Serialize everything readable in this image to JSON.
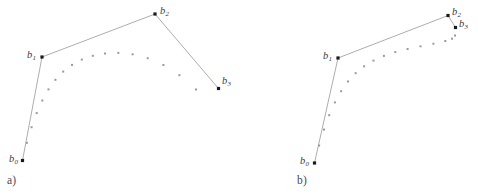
{
  "figure": {
    "background_color": "#ffffff",
    "width": 478,
    "height": 194,
    "polygon_color": "#8a8a8a",
    "polygon_width": 0.7,
    "sample_dot_color": "#9a9a9a",
    "control_point_color": "#1a1a1a",
    "label_color": "#3a3a3a"
  },
  "panels": [
    {
      "id": "a",
      "caption": "a)",
      "caption_x": 7,
      "caption_y": 174,
      "control_points": [
        {
          "name": "b0",
          "letter": "b",
          "sub": "0",
          "x": 22.5,
          "y": 160.5,
          "label_x": 9,
          "label_y": 154,
          "label_anchor": "left"
        },
        {
          "name": "b1",
          "letter": "b",
          "sub": "1",
          "x": 42.0,
          "y": 57.0,
          "label_x": 27,
          "label_y": 50,
          "label_anchor": "left"
        },
        {
          "name": "b2",
          "letter": "b",
          "sub": "2",
          "x": 155.0,
          "y": 14.0,
          "label_x": 160,
          "label_y": 6,
          "label_anchor": "left"
        },
        {
          "name": "b3",
          "letter": "b",
          "sub": "3",
          "x": 218.5,
          "y": 88.5,
          "label_x": 222,
          "label_y": 76,
          "label_anchor": "left"
        }
      ],
      "sample_dots": [
        {
          "t": 0.06,
          "x": 26.9,
          "y": 142.8
        },
        {
          "t": 0.12,
          "x": 31.6,
          "y": 127.2
        },
        {
          "t": 0.18,
          "x": 36.7,
          "y": 113.1
        },
        {
          "t": 0.24,
          "x": 42.3,
          "y": 100.5
        },
        {
          "t": 0.3,
          "x": 48.5,
          "y": 89.4
        },
        {
          "t": 0.36,
          "x": 55.4,
          "y": 79.8
        },
        {
          "t": 0.42,
          "x": 63.2,
          "y": 71.6
        },
        {
          "t": 0.48,
          "x": 72.0,
          "y": 64.9
        },
        {
          "t": 0.54,
          "x": 81.8,
          "y": 59.6
        },
        {
          "t": 0.6,
          "x": 92.8,
          "y": 55.8
        },
        {
          "t": 0.66,
          "x": 105.0,
          "y": 53.5
        },
        {
          "t": 0.72,
          "x": 118.3,
          "y": 52.9
        },
        {
          "t": 0.78,
          "x": 132.6,
          "y": 54.3
        },
        {
          "t": 0.84,
          "x": 147.7,
          "y": 58.2
        },
        {
          "t": 0.9,
          "x": 163.4,
          "y": 65.0
        },
        {
          "t": 0.96,
          "x": 179.4,
          "y": 75.2
        },
        {
          "t": 1.0,
          "x": 196.0,
          "y": 89.5
        }
      ]
    },
    {
      "id": "b",
      "caption": "b)",
      "caption_x": 58,
      "caption_y": 174,
      "control_points": [
        {
          "name": "b0",
          "letter": "b",
          "sub": "0",
          "x": 75.5,
          "y": 163.0,
          "label_x": 61,
          "label_y": 156,
          "label_anchor": "left"
        },
        {
          "name": "b1",
          "letter": "b",
          "sub": "1",
          "x": 99.0,
          "y": 58.0,
          "label_x": 84,
          "label_y": 51,
          "label_anchor": "left"
        },
        {
          "name": "b2",
          "letter": "b",
          "sub": "2",
          "x": 209.0,
          "y": 15.5,
          "label_x": 213,
          "label_y": 7,
          "label_anchor": "left"
        },
        {
          "name": "b3",
          "letter": "b",
          "sub": "3",
          "x": 216.5,
          "y": 27.5,
          "label_x": 220,
          "label_y": 19,
          "label_anchor": "left"
        }
      ],
      "sample_dots": [
        {
          "t": 0.06,
          "x": 80.1,
          "y": 145.5
        },
        {
          "t": 0.12,
          "x": 85.0,
          "y": 129.6
        },
        {
          "t": 0.18,
          "x": 90.2,
          "y": 115.2
        },
        {
          "t": 0.24,
          "x": 95.9,
          "y": 102.4
        },
        {
          "t": 0.3,
          "x": 102.1,
          "y": 91.2
        },
        {
          "t": 0.36,
          "x": 109.0,
          "y": 81.5
        },
        {
          "t": 0.42,
          "x": 116.6,
          "y": 73.2
        },
        {
          "t": 0.48,
          "x": 125.1,
          "y": 66.3
        },
        {
          "t": 0.54,
          "x": 134.5,
          "y": 60.6
        },
        {
          "t": 0.6,
          "x": 144.9,
          "y": 55.9
        },
        {
          "t": 0.66,
          "x": 156.3,
          "y": 52.1
        },
        {
          "t": 0.72,
          "x": 168.6,
          "y": 49.0
        },
        {
          "t": 0.78,
          "x": 181.5,
          "y": 46.3
        },
        {
          "t": 0.84,
          "x": 194.4,
          "y": 43.7
        },
        {
          "t": 0.9,
          "x": 206.3,
          "y": 41.0
        },
        {
          "t": 0.94,
          "x": 213.0,
          "y": 38.7
        },
        {
          "t": 0.97,
          "x": 216.0,
          "y": 35.5
        }
      ]
    }
  ]
}
